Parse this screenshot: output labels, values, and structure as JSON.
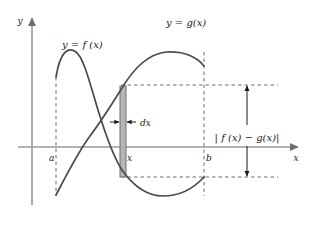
{
  "figure": {
    "kind": "calculus-area-between-curves-diagram",
    "background_color": "#ffffff",
    "curve_color": "#4a4a4a",
    "axis_color": "#9a9a9a",
    "dashed_color": "#6e6e6e",
    "strip_fill_color": "#b5b5b5",
    "strip_stroke_color": "#6e6e6e",
    "arrow_color": "#1a1a1a",
    "text_color": "#1a1a1a"
  },
  "axes": {
    "y_axis_label": "y",
    "x_axis_label": "x",
    "origin_x": 32,
    "x_axis_y": 147,
    "y_axis_top": 18,
    "x_axis_right": 298
  },
  "labels": {
    "f_curve": "y = f (x)",
    "g_curve": "y = g(x)",
    "tick_a": "a",
    "tick_x": "x",
    "tick_b": "b",
    "dx": "dx",
    "difference": "| f (x) − g(x)|"
  },
  "chart_data": {
    "type": "line",
    "title": "",
    "xlabel": "x",
    "ylabel": "y",
    "grid": false,
    "legend": "inline-curve-labels",
    "annotations": [
      {
        "name": "f-curve-label",
        "text": "y = f (x)",
        "x": 62,
        "y": 46
      },
      {
        "name": "g-curve-label",
        "text": "y = g(x)",
        "x": 168,
        "y": 28
      },
      {
        "name": "dx-label",
        "text": "dx",
        "x": 141,
        "y": 125
      },
      {
        "name": "difference-label",
        "text": "| f (x) − g(x)|",
        "x": 214,
        "y": 142
      },
      {
        "name": "tick-a-label",
        "text": "a",
        "x": 52,
        "y": 160
      },
      {
        "name": "tick-x-label",
        "text": "x",
        "x": 129,
        "y": 160
      },
      {
        "name": "tick-b-label",
        "text": "b",
        "x": 208,
        "y": 160
      }
    ],
    "series": [
      {
        "name": "f(x)",
        "path": "M 56,77 C 60,52 68,46 76,52 C 84,58 90,84 98,110 C 106,136 114,158 122,170 C 132,184 146,196 163,196 C 180,196 194,188 204,177",
        "description": "starts at x=a high, rises to local max, falls steeply crossing g, reaches minimum below the lower dashed level, rises to b"
      },
      {
        "name": "g(x)",
        "path": "M 56,195 C 66,176 78,152 90,136 C 102,120 112,104 122,88 C 134,68 148,54 166,52 C 182,51 196,56 204,66",
        "description": "starts low at x=a, rises crossing f, peaks near x=170, descends slightly to b"
      }
    ],
    "markers": {
      "intersection_point": {
        "x": 98,
        "y": 127
      },
      "strip": {
        "x_left": 120,
        "x_right": 126,
        "y_top": 86,
        "y_bottom": 177
      },
      "upper_dashed_level_y": 85,
      "lower_dashed_level_y": 177,
      "vertical_dashed_a_x": 56,
      "vertical_dashed_b_x": 204,
      "difference_arrow_x": 247,
      "difference_arrow_top_y": 85,
      "difference_arrow_bottom_y": 177
    }
  }
}
